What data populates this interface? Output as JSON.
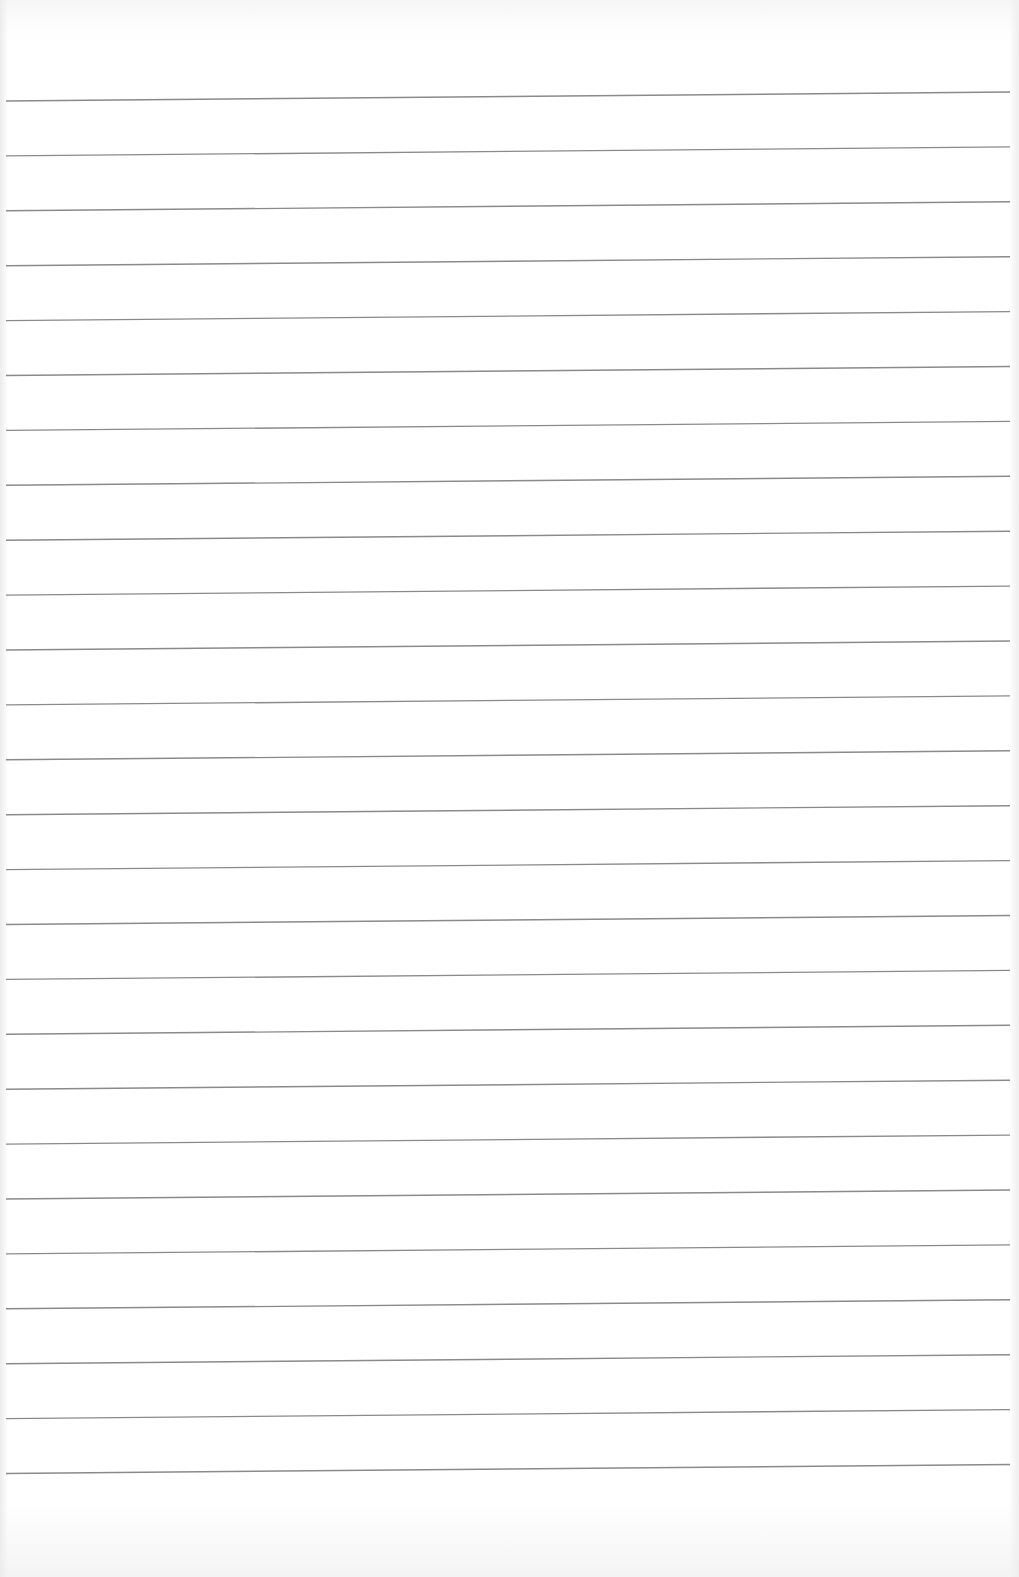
{
  "paper": {
    "type": "ruled-sheet",
    "background_color": "#ffffff",
    "line_color": "#8a8a8a",
    "line_count": 26,
    "first_line_y_left": 101,
    "first_line_y_right": 92,
    "line_spacing": 54.9,
    "line_x_start": 6,
    "line_x_end": 1010
  }
}
